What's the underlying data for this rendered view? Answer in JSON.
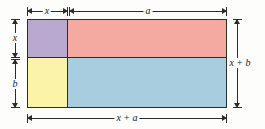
{
  "diagram": {
    "background_color": "#fdfdfc",
    "stroke_color": "#2b2b2b",
    "regions": [
      {
        "name": "top-left",
        "label": "",
        "color": "#b9a8cf",
        "width_term": "x",
        "height_term": "x"
      },
      {
        "name": "top-right",
        "label": "",
        "color": "#f4a9a1",
        "width_term": "a",
        "height_term": "x"
      },
      {
        "name": "bottom-left",
        "label": "",
        "color": "#faf3a8",
        "width_term": "x",
        "height_term": "b"
      },
      {
        "name": "bottom-right",
        "label": "",
        "color": "#a7cdde",
        "width_term": "a",
        "height_term": "b"
      }
    ],
    "dimensions": {
      "top_left": "x",
      "top_right": "a",
      "left_upper": "x",
      "left_lower": "b",
      "right_total": "x + b",
      "bottom_total": "x + a"
    }
  }
}
